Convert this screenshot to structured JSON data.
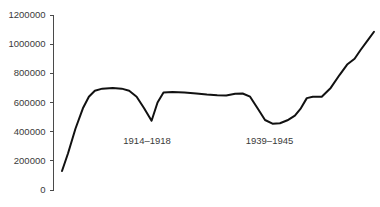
{
  "chart_data": {
    "type": "line",
    "title": "",
    "subtitle": "",
    "xlabel": "",
    "ylabel": "",
    "grid": false,
    "legend": "none",
    "ylim": [
      0,
      1200000
    ],
    "ytick_labels": [
      "1200000",
      "1000000",
      "800000",
      "600000",
      "400000",
      "200000",
      "0"
    ],
    "ytick_values": [
      1200000,
      1000000,
      800000,
      600000,
      400000,
      200000,
      0
    ],
    "series": [
      {
        "name": "",
        "points": [
          {
            "x": 0,
            "y": 130000
          },
          {
            "x": 4,
            "y": 250000
          },
          {
            "x": 9,
            "y": 420000
          },
          {
            "x": 14,
            "y": 560000
          },
          {
            "x": 18,
            "y": 640000
          },
          {
            "x": 22,
            "y": 680000
          },
          {
            "x": 27,
            "y": 695000
          },
          {
            "x": 34,
            "y": 700000
          },
          {
            "x": 40,
            "y": 695000
          },
          {
            "x": 45,
            "y": 680000
          },
          {
            "x": 50,
            "y": 640000
          },
          {
            "x": 55,
            "y": 560000
          },
          {
            "x": 60,
            "y": 475000
          },
          {
            "x": 64,
            "y": 600000
          },
          {
            "x": 68,
            "y": 668000
          },
          {
            "x": 74,
            "y": 672000
          },
          {
            "x": 82,
            "y": 668000
          },
          {
            "x": 90,
            "y": 662000
          },
          {
            "x": 97,
            "y": 655000
          },
          {
            "x": 104,
            "y": 650000
          },
          {
            "x": 110,
            "y": 648000
          },
          {
            "x": 116,
            "y": 660000
          },
          {
            "x": 121,
            "y": 662000
          },
          {
            "x": 126,
            "y": 640000
          },
          {
            "x": 131,
            "y": 560000
          },
          {
            "x": 136,
            "y": 480000
          },
          {
            "x": 141,
            "y": 455000
          },
          {
            "x": 146,
            "y": 458000
          },
          {
            "x": 151,
            "y": 478000
          },
          {
            "x": 156,
            "y": 510000
          },
          {
            "x": 160,
            "y": 560000
          },
          {
            "x": 164,
            "y": 630000
          },
          {
            "x": 168,
            "y": 640000
          },
          {
            "x": 174,
            "y": 640000
          },
          {
            "x": 180,
            "y": 700000
          },
          {
            "x": 186,
            "y": 790000
          },
          {
            "x": 191,
            "y": 860000
          },
          {
            "x": 196,
            "y": 900000
          },
          {
            "x": 200,
            "y": 960000
          },
          {
            "x": 205,
            "y": 1030000
          },
          {
            "x": 209,
            "y": 1085000
          }
        ]
      }
    ],
    "annotations": [
      {
        "text": "1914–1918",
        "x": 57,
        "y": 330000
      },
      {
        "text": "1939–1945",
        "x": 139,
        "y": 330000
      }
    ],
    "colors": {
      "line": "#111111",
      "axis": "#4a4a4a",
      "text": "#3a3a3a",
      "background": "#ffffff"
    }
  }
}
